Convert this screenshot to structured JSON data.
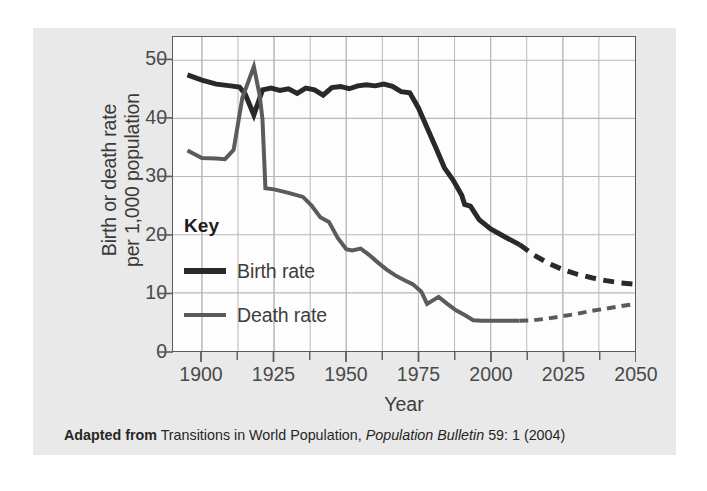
{
  "chart_data": {
    "type": "line",
    "title": "",
    "xlabel": "Year",
    "ylabel": "Birth or death rate per 1,000 population",
    "ylabel_line1": "Birth or death rate",
    "ylabel_line2": "per 1,000 population",
    "xlim": [
      1890,
      2050
    ],
    "ylim": [
      0,
      54
    ],
    "y_ticks": [
      0,
      10,
      20,
      30,
      40,
      50
    ],
    "y_tick_labels": [
      "0",
      "10",
      "20",
      "30",
      "40",
      "50"
    ],
    "x_ticks": [
      1900,
      1925,
      1950,
      1975,
      2000,
      2025,
      2050
    ],
    "x_tick_labels": [
      "1900",
      "1925",
      "1950",
      "1975",
      "2000",
      "2025",
      "2050"
    ],
    "x_minor_tick_step": 12.5,
    "grid": true,
    "grid_color": "#b9b9b9",
    "legend_position": "inside-lower-left",
    "legend_title": "Key",
    "series": [
      {
        "name": "Birth rate",
        "color": "#292929",
        "width": 5.0,
        "observed": [
          [
            1895,
            47.5
          ],
          [
            1900,
            46.6
          ],
          [
            1905,
            45.9
          ],
          [
            1910,
            45.6
          ],
          [
            1913,
            45.4
          ],
          [
            1915,
            44.2
          ],
          [
            1918,
            40.6
          ],
          [
            1921,
            44.9
          ],
          [
            1924,
            45.2
          ],
          [
            1927,
            44.8
          ],
          [
            1930,
            45.1
          ],
          [
            1933,
            44.3
          ],
          [
            1936,
            45.2
          ],
          [
            1939,
            44.9
          ],
          [
            1942,
            44.0
          ],
          [
            1945,
            45.3
          ],
          [
            1948,
            45.5
          ],
          [
            1951,
            45.1
          ],
          [
            1954,
            45.6
          ],
          [
            1957,
            45.8
          ],
          [
            1960,
            45.6
          ],
          [
            1963,
            45.9
          ],
          [
            1966,
            45.5
          ],
          [
            1969,
            44.6
          ],
          [
            1972,
            44.4
          ],
          [
            1975,
            41.8
          ],
          [
            1978,
            38.4
          ],
          [
            1981,
            35.0
          ],
          [
            1984,
            31.5
          ],
          [
            1987,
            29.4
          ],
          [
            1990,
            26.8
          ],
          [
            1991,
            25.2
          ],
          [
            1993,
            24.9
          ],
          [
            1996,
            22.6
          ],
          [
            2000,
            21.0
          ],
          [
            2005,
            19.6
          ],
          [
            2010,
            18.3
          ]
        ],
        "projected": [
          [
            2010,
            18.3
          ],
          [
            2015,
            16.5
          ],
          [
            2020,
            15.1
          ],
          [
            2025,
            14.0
          ],
          [
            2030,
            13.2
          ],
          [
            2035,
            12.6
          ],
          [
            2040,
            12.1
          ],
          [
            2045,
            11.7
          ],
          [
            2050,
            11.5
          ]
        ]
      },
      {
        "name": "Death rate",
        "color": "#5b5b5b",
        "width": 4.0,
        "observed": [
          [
            1895,
            34.5
          ],
          [
            1900,
            33.2
          ],
          [
            1905,
            33.1
          ],
          [
            1908,
            33.0
          ],
          [
            1911,
            34.6
          ],
          [
            1914,
            43.5
          ],
          [
            1918,
            48.9
          ],
          [
            1920,
            44.0
          ],
          [
            1921,
            39.8
          ],
          [
            1922,
            28.0
          ],
          [
            1925,
            27.8
          ],
          [
            1930,
            27.2
          ],
          [
            1935,
            26.5
          ],
          [
            1938,
            25.0
          ],
          [
            1941,
            23.0
          ],
          [
            1944,
            22.2
          ],
          [
            1947,
            19.5
          ],
          [
            1950,
            17.5
          ],
          [
            1952,
            17.3
          ],
          [
            1955,
            17.6
          ],
          [
            1958,
            16.5
          ],
          [
            1961,
            15.2
          ],
          [
            1964,
            14.0
          ],
          [
            1967,
            13.0
          ],
          [
            1970,
            12.2
          ],
          [
            1973,
            11.5
          ],
          [
            1976,
            10.2
          ],
          [
            1978,
            8.1
          ],
          [
            1982,
            9.3
          ],
          [
            1985,
            8.1
          ],
          [
            1988,
            7.0
          ],
          [
            1991,
            6.2
          ],
          [
            1994,
            5.3
          ],
          [
            1997,
            5.2
          ],
          [
            2000,
            5.2
          ],
          [
            2005,
            5.2
          ],
          [
            2010,
            5.2
          ]
        ],
        "projected": [
          [
            2010,
            5.2
          ],
          [
            2015,
            5.3
          ],
          [
            2020,
            5.6
          ],
          [
            2025,
            6.0
          ],
          [
            2030,
            6.4
          ],
          [
            2035,
            6.9
          ],
          [
            2040,
            7.3
          ],
          [
            2045,
            7.7
          ],
          [
            2050,
            8.1
          ]
        ]
      }
    ]
  },
  "chart": {
    "y_axis_title_line1": "Birth or death rate",
    "y_axis_title_line2": "per 1,000 population",
    "x_axis_title": "Year"
  },
  "legend": {
    "title": "Key",
    "items": [
      {
        "label": "Birth rate",
        "color": "#292929"
      },
      {
        "label": "Death rate",
        "color": "#5b5b5b"
      }
    ]
  },
  "caption": {
    "prefix": "Adapted from",
    "source_title": "Transitions in World Population,",
    "publication": "Population Bulletin",
    "citation": "59: 1 (2004)"
  }
}
